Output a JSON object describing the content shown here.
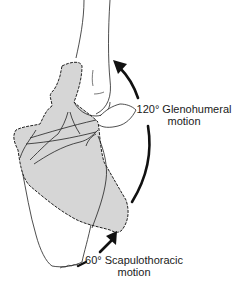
{
  "figure": {
    "colors": {
      "scapula_fill": "#d6d6d6",
      "outline": "#222222",
      "arrow": "#111111",
      "background": "#ffffff"
    }
  },
  "annotations": {
    "glenohumeral": {
      "line1": "120° Glenohumeral",
      "line2": "motion"
    },
    "scapulothoracic": {
      "line1": "60° Scapulothoracic",
      "line2": "motion"
    }
  },
  "parts": {
    "humerus": "humerus",
    "scapula_rotated": "scapula-rotated",
    "scapula_resting": "scapula-resting",
    "acromion": "acromion",
    "clavicle": "clavicle"
  }
}
